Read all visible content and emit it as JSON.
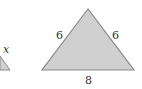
{
  "diagram": {
    "colors": {
      "fill": "#d0d0d0",
      "stroke": "#8a8a8a",
      "text": "#333333"
    },
    "left_triangle": {
      "side_label": "x"
    },
    "main_triangle": {
      "left_side": "6",
      "right_side": "6",
      "base": "8"
    }
  }
}
